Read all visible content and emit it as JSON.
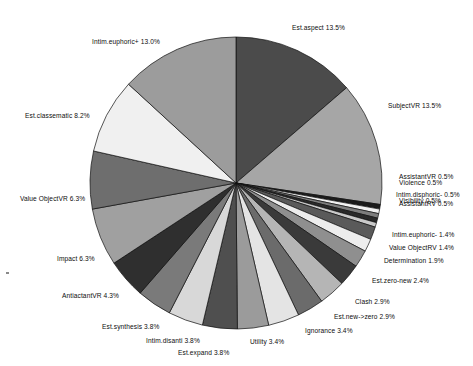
{
  "chart_data": {
    "type": "pie",
    "title": "",
    "subtitle": "",
    "xlabel": "",
    "ylabel": "",
    "legend_position": "none",
    "grid": false,
    "label_format": "name percent",
    "start_angle_deg": -90,
    "direction": "clockwise",
    "center": {
      "cx": 236,
      "cy": 183
    },
    "radius": 146,
    "categories": [
      "Est.aspect",
      "SubjectVR",
      "AssistantVR",
      "Violence",
      "Intim.disphoric-",
      "Visibility",
      "AssistantRV",
      "Intim.euphoric-",
      "Value ObjectRV",
      "Determination",
      "Est.zero-new",
      "Clash",
      "Est.new->zero",
      "Ignorance",
      "Utility",
      "Est.expand",
      "Intim.disanti",
      "Est.synthesis",
      "AntiactantVR",
      "Impact",
      "Value ObjectVR",
      "Est.classematic",
      "Intim.euphoric+"
    ],
    "values": [
      13.5,
      13.5,
      0.5,
      0.5,
      0.5,
      0.5,
      0.5,
      1.4,
      1.4,
      1.9,
      2.4,
      2.9,
      2.9,
      3.4,
      3.4,
      3.8,
      3.8,
      3.8,
      4.3,
      6.3,
      6.3,
      8.2,
      13.0
    ],
    "unit": "%",
    "colors": [
      "#4b4b4b",
      "#a6a6a6",
      "#1c1c1c",
      "#f2f2f2",
      "#7d7d7d",
      "#2a2a2a",
      "#c9c9c9",
      "#5a5a5a",
      "#ededed",
      "#8f8f8f",
      "#3a3a3a",
      "#b5b5b5",
      "#6b6b6b",
      "#e4e4e4",
      "#9b9b9b",
      "#4f4f4f",
      "#d8d8d8",
      "#7a7a7a",
      "#2f2f2f",
      "#a0a0a0",
      "#6e6e6e",
      "#f0f0f0",
      "#9c9c9c"
    ],
    "slices": [
      {
        "label": "Est.aspect",
        "percent": 13.5,
        "text": "Est.aspect  13.5%",
        "color": "#4b4b4b",
        "side": "right"
      },
      {
        "label": "SubjectVR",
        "percent": 13.5,
        "text": "SubjectVR  13.5%",
        "color": "#a6a6a6",
        "side": "right"
      },
      {
        "label": "AssistantVR",
        "percent": 0.5,
        "text": "AssistantVR  0.5%",
        "color": "#1c1c1c",
        "side": "right"
      },
      {
        "label": "Violence",
        "percent": 0.5,
        "text": "Violence  0.5%",
        "color": "#f2f2f2",
        "side": "right"
      },
      {
        "label": "Intim.disphoric-",
        "percent": 0.5,
        "text": "Intim.disphoric-  0.5%",
        "color": "#7d7d7d",
        "side": "right"
      },
      {
        "label": "Visibility",
        "percent": 0.5,
        "text": "Visibility  0.5%",
        "color": "#2a2a2a",
        "side": "right"
      },
      {
        "label": "AssistantRV",
        "percent": 0.5,
        "text": "AssistantRV  0.5%",
        "color": "#c9c9c9",
        "side": "right"
      },
      {
        "label": "Intim.euphoric-",
        "percent": 1.4,
        "text": "Intim.euphoric-  1.4%",
        "color": "#5a5a5a",
        "side": "right"
      },
      {
        "label": "Value ObjectRV",
        "percent": 1.4,
        "text": "Value ObjectRV  1.4%",
        "color": "#ededed",
        "side": "right"
      },
      {
        "label": "Determination",
        "percent": 1.9,
        "text": "Determination  1.9%",
        "color": "#8f8f8f",
        "side": "right"
      },
      {
        "label": "Est.zero-new",
        "percent": 2.4,
        "text": "Est.zero-new  2.4%",
        "color": "#3a3a3a",
        "side": "right"
      },
      {
        "label": "Clash",
        "percent": 2.9,
        "text": "Clash  2.9%",
        "color": "#b5b5b5",
        "side": "right"
      },
      {
        "label": "Est.new->zero",
        "percent": 2.9,
        "text": "Est.new->zero  2.9%",
        "color": "#6b6b6b",
        "side": "right"
      },
      {
        "label": "Ignorance",
        "percent": 3.4,
        "text": "Ignorance  3.4%",
        "color": "#e4e4e4",
        "side": "right"
      },
      {
        "label": "Utility",
        "percent": 3.4,
        "text": "Utility  3.4%",
        "color": "#9b9b9b",
        "side": "bottom"
      },
      {
        "label": "Est.expand",
        "percent": 3.8,
        "text": "Est.expand  3.8%",
        "color": "#4f4f4f",
        "side": "bottom"
      },
      {
        "label": "Intim.disanti",
        "percent": 3.8,
        "text": "Intim.disanti  3.8%",
        "color": "#d8d8d8",
        "side": "bottom"
      },
      {
        "label": "Est.synthesis",
        "percent": 3.8,
        "text": "Est.synthesis  3.8%",
        "color": "#7a7a7a",
        "side": "left"
      },
      {
        "label": "AntiactantVR",
        "percent": 4.3,
        "text": "AntiactantVR  4.3%",
        "color": "#2f2f2f",
        "side": "left"
      },
      {
        "label": "Impact",
        "percent": 6.3,
        "text": "Impact  6.3%",
        "color": "#a0a0a0",
        "side": "left"
      },
      {
        "label": "Value ObjectVR",
        "percent": 6.3,
        "text": "Value ObjectVR  6.3%",
        "color": "#6e6e6e",
        "side": "left"
      },
      {
        "label": "Est.classematic",
        "percent": 8.2,
        "text": "Est.classematic  8.2%",
        "color": "#f0f0f0",
        "side": "left"
      },
      {
        "label": "Intim.euphoric+",
        "percent": 13.0,
        "text": "Intim.euphoric+  13.0%",
        "color": "#9c9c9c",
        "side": "left"
      }
    ]
  },
  "labels": {
    "est_aspect": {
      "text": "Est.aspect  13.5%",
      "x": 292,
      "y": 24
    },
    "intim_euphoric_p": {
      "text": "Intim.euphoric+  13.0%",
      "x": 92,
      "y": 38
    },
    "est_classematic": {
      "text": "Est.classematic  8.2%",
      "x": 25,
      "y": 112
    },
    "subjectvr": {
      "text": "SubjectVR  13.5%",
      "x": 388,
      "y": 102
    },
    "assistantvr": {
      "text": "AssistantVR  0.5%",
      "x": 399,
      "y": 173
    },
    "violence": {
      "text": "Violence  0.5%",
      "x": 399,
      "y": 179
    },
    "intim_disphoric": {
      "text": "Intim.disphoric-  0.5%",
      "x": 396,
      "y": 191
    },
    "visibility": {
      "text": "Visibility  0.5%",
      "x": 399,
      "y": 197
    },
    "assistantrv": {
      "text": "AssistantRV  0.5%",
      "x": 399,
      "y": 200
    },
    "intim_euphoric_m": {
      "text": "Intim.euphoric-  1.4%",
      "x": 392,
      "y": 231
    },
    "value_objectrv": {
      "text": "Value ObjectRV  1.4%",
      "x": 389,
      "y": 244
    },
    "determination": {
      "text": "Determination  1.9%",
      "x": 384,
      "y": 257
    },
    "est_zero_new": {
      "text": "Est.zero-new  2.4%",
      "x": 372,
      "y": 277
    },
    "clash": {
      "text": "Clash  2.9%",
      "x": 355,
      "y": 298
    },
    "est_new_zero": {
      "text": "Est.new->zero  2.9%",
      "x": 334,
      "y": 313
    },
    "ignorance": {
      "text": "Ignorance  3.4%",
      "x": 305,
      "y": 327
    },
    "utility": {
      "text": "Utility  3.4%",
      "x": 250,
      "y": 338
    },
    "est_expand": {
      "text": "Est.expand  3.8%",
      "x": 178,
      "y": 349
    },
    "intim_disanti": {
      "text": "Intim.disanti  3.8%",
      "x": 146,
      "y": 337
    },
    "est_synthesis": {
      "text": "Est.synthesis  3.8%",
      "x": 102,
      "y": 323
    },
    "antiactantvr": {
      "text": "AntiactantVR  4.3%",
      "x": 62,
      "y": 292
    },
    "impact": {
      "text": "Impact  6.3%",
      "x": 57,
      "y": 255
    },
    "value_objectvr": {
      "text": "Value ObjectVR  6.3%",
      "x": 20,
      "y": 195
    }
  }
}
